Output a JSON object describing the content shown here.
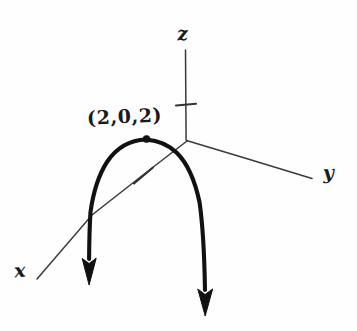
{
  "figure": {
    "kind": "hand-drawn 3D coordinate sketch",
    "background_color": "#fefefe",
    "ink_color": "#111113",
    "axis_color": "#3a3a3c"
  },
  "axes": {
    "z": {
      "label": "z",
      "tick_count": 1
    },
    "y": {
      "label": "y",
      "tick_count": 0
    },
    "x": {
      "label": "x",
      "tick_count": 1
    }
  },
  "annotations": {
    "point_label": "(2,0,2)"
  },
  "curve": {
    "arrow_count": 2
  }
}
